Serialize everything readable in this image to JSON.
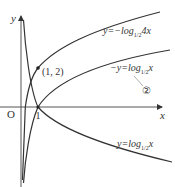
{
  "figure": {
    "type": "logarithm-graphs",
    "axes": {
      "x_label": "x",
      "y_label": "y",
      "origin_label": "O",
      "x_tick_label": "1"
    },
    "point": {
      "label": "(1, 2)",
      "x": 1,
      "y": 2
    },
    "curves": [
      {
        "id": "curve-neg-log-half-4x",
        "label_prefix": "y=−log",
        "base": "1/2",
        "label_suffix": "4x",
        "equation": "y = -log_{1/2}(4x)"
      },
      {
        "id": "curve-neg-y-log-half-x",
        "label_prefix": "−y=log",
        "base": "1/2",
        "label_suffix": "x",
        "equation": "-y = log_{1/2}(x)",
        "marker": "②"
      },
      {
        "id": "curve-log-half-x",
        "label_prefix": "y=log",
        "base": "1/2",
        "label_suffix": "x",
        "equation": "y = log_{1/2}(x)"
      }
    ],
    "colors": {
      "curve": "#333333",
      "axis": "#333333",
      "background": "#ffffff"
    }
  }
}
